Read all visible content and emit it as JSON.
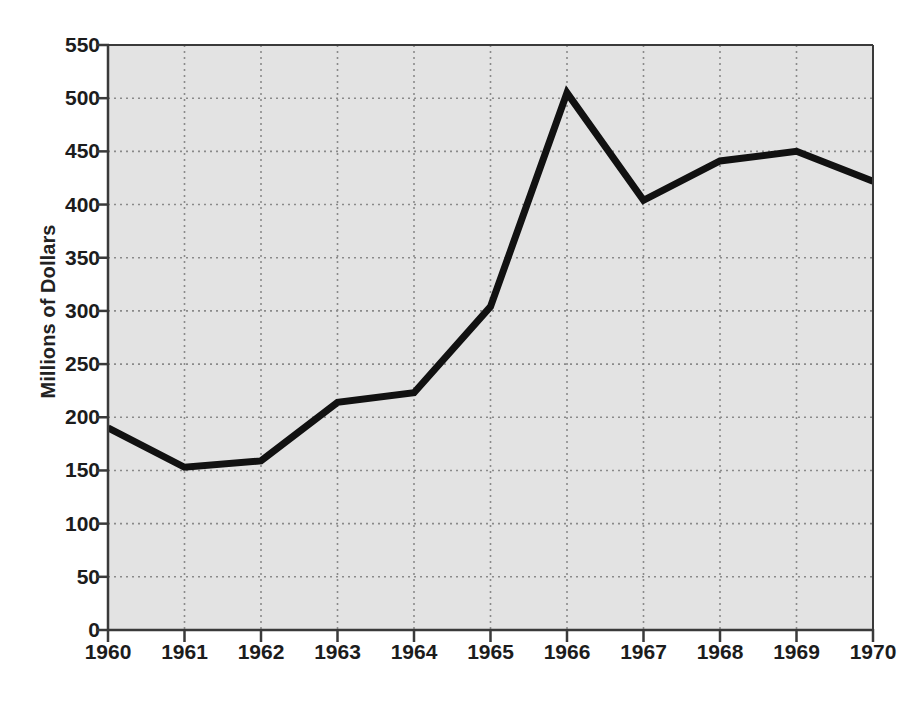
{
  "chart_data": {
    "type": "line",
    "title": "",
    "subtitle": "",
    "xlabel": "",
    "ylabel": "Millions of Dollars",
    "categories": [
      "1960",
      "1961",
      "1962",
      "1963",
      "1964",
      "1965",
      "1966",
      "1967",
      "1968",
      "1969",
      "1970"
    ],
    "x": [
      1960,
      1961,
      1962,
      1963,
      1964,
      1965,
      1966,
      1967,
      1968,
      1969,
      1970
    ],
    "values": [
      190,
      153,
      159,
      214,
      223,
      304,
      505,
      404,
      441,
      450,
      422
    ],
    "series": [
      {
        "name": "Millions of Dollars",
        "values": [
          190,
          153,
          159,
          214,
          223,
          304,
          505,
          404,
          441,
          450,
          422
        ]
      }
    ],
    "xlim": [
      1960,
      1970
    ],
    "ylim": [
      0,
      550
    ],
    "ytick_labels": [
      "0",
      "50",
      "100",
      "150",
      "200",
      "250",
      "300",
      "350",
      "400",
      "450",
      "500",
      "550"
    ],
    "yticks": [
      0,
      50,
      100,
      150,
      200,
      250,
      300,
      350,
      400,
      450,
      500,
      550
    ],
    "xtick_labels": [
      "1960",
      "1961",
      "1962",
      "1963",
      "1964",
      "1965",
      "1966",
      "1967",
      "1968",
      "1969",
      "1970"
    ],
    "grid": true,
    "grid_style": "dotted",
    "legend": false,
    "legend_position": "none",
    "line_color": "#111111",
    "line_width": 7,
    "plot_background": "#e3e3e3",
    "figure_background": "#ffffff",
    "grid_color": "#8a8a8a",
    "axis_color": "#3a3a3a",
    "text_color": "#1c1c1c"
  }
}
